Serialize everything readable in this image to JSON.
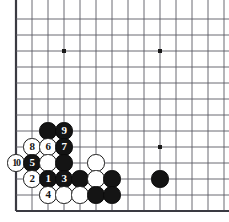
{
  "board": {
    "title": "go-board-corner-diagram",
    "type": "go",
    "grid": {
      "origin_x": 16,
      "origin_y": 19,
      "spacing": 16,
      "cols": 13,
      "rows": 12,
      "left_edge": true,
      "bottom_edge": true,
      "top_edge_clipped": true,
      "right_edge_clipped": true,
      "line_color": "#5a5a63",
      "edge_color": "#3a3a42",
      "background_color": "#ffffff"
    },
    "star_points": [
      {
        "name": "star-point-upper-left",
        "col": 3,
        "row": 2
      },
      {
        "name": "star-point-upper-right",
        "col": 9,
        "row": 2
      },
      {
        "name": "star-point-lower-right",
        "col": 9,
        "row": 8
      }
    ],
    "stone_colors": {
      "black": "#141414",
      "white": "#ffffff",
      "white_outline": "#1a1a1a",
      "black_label": "#ffffff",
      "white_label": "#141414"
    },
    "stones": [
      {
        "id": "stone-b-c2r7",
        "color": "black",
        "col": 2,
        "row": 7,
        "label": ""
      },
      {
        "id": "stone-b-c3r7",
        "color": "black",
        "col": 3,
        "row": 7,
        "label": "9"
      },
      {
        "id": "stone-w-c1r8",
        "color": "white",
        "col": 1,
        "row": 8,
        "label": "8"
      },
      {
        "id": "stone-w-c2r8",
        "color": "white",
        "col": 2,
        "row": 8,
        "label": "6"
      },
      {
        "id": "stone-b-c3r8",
        "color": "black",
        "col": 3,
        "row": 8,
        "label": "7"
      },
      {
        "id": "stone-w-c0r9",
        "color": "white",
        "col": 0,
        "row": 9,
        "label": "10"
      },
      {
        "id": "stone-b-c1r9",
        "color": "black",
        "col": 1,
        "row": 9,
        "label": "5"
      },
      {
        "id": "stone-w-c2r9",
        "color": "white",
        "col": 2,
        "row": 9,
        "label": ""
      },
      {
        "id": "stone-b-c3r9",
        "color": "black",
        "col": 3,
        "row": 9,
        "label": ""
      },
      {
        "id": "stone-w-c5r9",
        "color": "white",
        "col": 5,
        "row": 9,
        "label": ""
      },
      {
        "id": "stone-w-c1r10",
        "color": "white",
        "col": 1,
        "row": 10,
        "label": "2"
      },
      {
        "id": "stone-b-c2r10",
        "color": "black",
        "col": 2,
        "row": 10,
        "label": "1"
      },
      {
        "id": "stone-b-c3r10",
        "color": "black",
        "col": 3,
        "row": 10,
        "label": "3"
      },
      {
        "id": "stone-b-c4r10",
        "color": "black",
        "col": 4,
        "row": 10,
        "label": ""
      },
      {
        "id": "stone-w-c5r10",
        "color": "white",
        "col": 5,
        "row": 10,
        "label": ""
      },
      {
        "id": "stone-b-c6r10",
        "color": "black",
        "col": 6,
        "row": 10,
        "label": ""
      },
      {
        "id": "stone-b-c9r10",
        "color": "black",
        "col": 9,
        "row": 10,
        "label": ""
      },
      {
        "id": "stone-w-c2r11",
        "color": "white",
        "col": 2,
        "row": 11,
        "label": "4"
      },
      {
        "id": "stone-w-c3r11",
        "color": "white",
        "col": 3,
        "row": 11,
        "label": ""
      },
      {
        "id": "stone-w-c4r11",
        "color": "white",
        "col": 4,
        "row": 11,
        "label": ""
      },
      {
        "id": "stone-b-c5r11",
        "color": "black",
        "col": 5,
        "row": 11,
        "label": ""
      },
      {
        "id": "stone-b-c6r11",
        "color": "black",
        "col": 6,
        "row": 11,
        "label": ""
      }
    ],
    "move_sequence": [
      {
        "move": 1,
        "color": "black"
      },
      {
        "move": 2,
        "color": "white"
      },
      {
        "move": 3,
        "color": "black"
      },
      {
        "move": 4,
        "color": "white"
      },
      {
        "move": 5,
        "color": "black"
      },
      {
        "move": 6,
        "color": "white"
      },
      {
        "move": 7,
        "color": "black"
      },
      {
        "move": 8,
        "color": "white"
      },
      {
        "move": 9,
        "color": "black"
      },
      {
        "move": 10,
        "color": "white"
      }
    ]
  }
}
